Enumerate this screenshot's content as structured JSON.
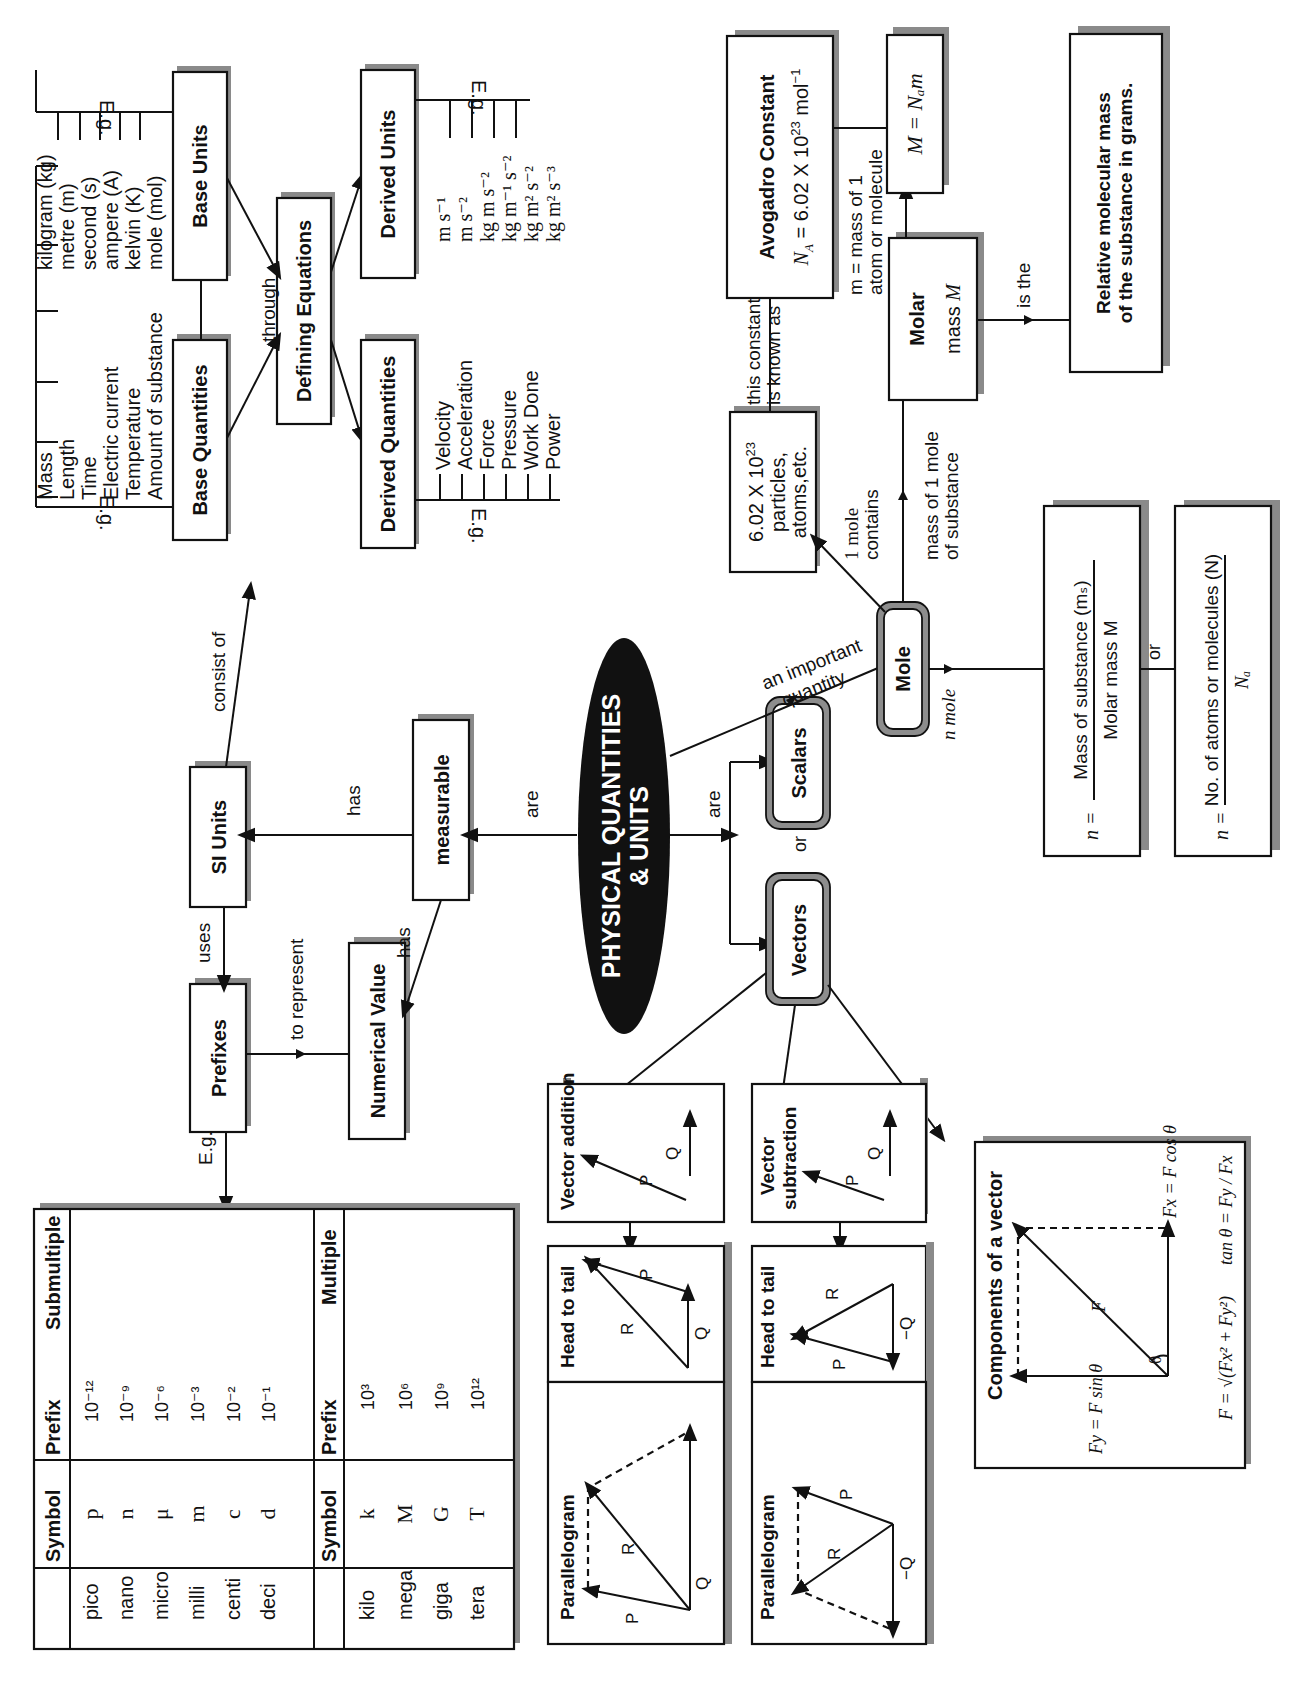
{
  "title": {
    "line1": "PHYSICAL QUANTITIES",
    "line2": "& UNITS"
  },
  "nodes": {
    "base_quantities": "Base Quantities",
    "base_units": "Base Units",
    "defining_equations": "Defining Equations",
    "derived_quantities": "Derived Quantities",
    "derived_units": "Derived Units",
    "si_units": "SI Units",
    "measurable": "measurable",
    "prefixes": "Prefixes",
    "numerical_value": "Numerical Value",
    "scalars": "Scalars",
    "vectors": "Vectors",
    "mole": "Mole",
    "particles": {
      "line1": "6.02 X 10",
      "sup": "23",
      "line2": "particles,",
      "line3": "atoms,etc."
    },
    "avogadro": {
      "title": "Avogadro Constant",
      "formula_lhs": "N",
      "formula_sub": "A",
      "formula_rhs": " = 6.02 X 10",
      "formula_sup": "23",
      "formula_unit": " mol",
      "formula_unit_sup": "−1"
    },
    "molar_mass": {
      "line1": "Molar",
      "line2": "mass ",
      "symbol": "M"
    },
    "molar_formula": "M = Nₐm",
    "relative_mass": {
      "line1": "Relative molecular mass",
      "line2": "of the substance in grams."
    },
    "formula_mass": {
      "lhs": "n =",
      "num": "Mass of substance (mₛ)",
      "den": "Molar mass M"
    },
    "formula_count": {
      "lhs": "n =",
      "num": "No. of atoms or molecules (N)",
      "den": "Nₐ"
    }
  },
  "examples": {
    "eg_label": "E.g.",
    "base_quantities": [
      "Mass",
      "Length",
      "Time",
      "Electric current",
      "Temperature",
      "Amount of substance"
    ],
    "base_units": [
      "kilogram (kg)",
      "metre (m)",
      "second (s)",
      "ampere (A)",
      "kelvin (K)",
      "mole (mol)"
    ],
    "derived_quantities": [
      "Velocity",
      "Acceleration",
      "Force",
      "Pressure",
      "Work Done",
      "Power"
    ],
    "derived_units": [
      "m s⁻¹",
      "m s⁻²",
      "kg m s⁻²",
      "kg m⁻¹ s⁻²",
      "kg m² s⁻²",
      "kg m² s⁻³"
    ]
  },
  "edges": {
    "consist_of": "consist of",
    "through": "through",
    "has_si": "has",
    "has_numeric": "has",
    "uses": "uses",
    "to_represent": "to represent",
    "are_left": "are",
    "are_right": "are",
    "or_sv": "or",
    "an_important_quantity": {
      "line1": "an important",
      "line2": "quantity"
    },
    "one_mole_contains": {
      "line1": "1 mole",
      "line2": "contains"
    },
    "mass_of_1_mole": {
      "line1": "mass of 1 mole",
      "line2": "of substance"
    },
    "this_constant": {
      "line1": "this constant",
      "line2": "is known as"
    },
    "m_mass_of_1": {
      "line1": "m = mass of 1",
      "line2": "atom or molecule"
    },
    "is_the": "is the",
    "n_mole": "n mole",
    "or_formula": "or",
    "eg_prefix": "E.g."
  },
  "prefix_table": {
    "submultiple": {
      "headers": [
        "Prefix",
        "Symbol",
        "Submultiple"
      ],
      "rows": [
        [
          "pico",
          "p",
          "10⁻¹²"
        ],
        [
          "nano",
          "n",
          "10⁻⁹"
        ],
        [
          "micro",
          "μ",
          "10⁻⁶"
        ],
        [
          "milli",
          "m",
          "10⁻³"
        ],
        [
          "centi",
          "c",
          "10⁻²"
        ],
        [
          "deci",
          "d",
          "10⁻¹"
        ]
      ]
    },
    "multiple": {
      "headers": [
        "Prefix",
        "Symbol",
        "Multiple"
      ],
      "rows": [
        [
          "kilo",
          "k",
          "10³"
        ],
        [
          "mega",
          "M",
          "10⁶"
        ],
        [
          "giga",
          "G",
          "10⁹"
        ],
        [
          "tera",
          "T",
          "10¹²"
        ]
      ]
    }
  },
  "vector_panels": {
    "addition": {
      "title": "Vector addition",
      "p": "P",
      "q": "Q"
    },
    "subtraction": {
      "title_line1": "Vector",
      "title_line2": "subtraction",
      "p": "P",
      "q": "Q"
    },
    "add_head_to_tail": {
      "title": "Head to tail",
      "p": "P",
      "q": "Q",
      "r": "R"
    },
    "add_parallelogram": {
      "title": "Parallelogram",
      "p": "P",
      "q": "Q",
      "r": "R"
    },
    "sub_head_to_tail": {
      "title": "Head to tail",
      "p": "P",
      "q": "−Q",
      "r": "R"
    },
    "sub_parallelogram": {
      "title": "Parallelogram",
      "p": "P",
      "q": "−Q",
      "r": "R"
    },
    "components": {
      "title": "Components of a vector",
      "f": "F",
      "theta": "θ",
      "fy": "Fy = F sin θ",
      "fx": "Fx = F cos θ",
      "magnitude": "F = √(Fx² + Fy²)",
      "tan": "tan θ = Fy / Fx"
    }
  }
}
